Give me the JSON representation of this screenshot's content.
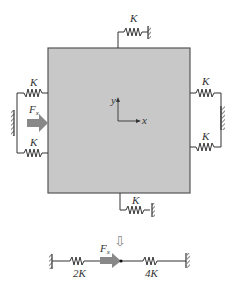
{
  "diagram": {
    "type": "spring-mass equivalence",
    "block": {
      "fill": "#c8c8c8",
      "border": "#555555"
    },
    "axes": {
      "x_label": "x",
      "y_label": "y"
    },
    "springs": {
      "top": {
        "label": "K"
      },
      "bottom": {
        "label": "K"
      },
      "left_upper": {
        "label": "K"
      },
      "left_lower": {
        "label": "K"
      },
      "right_upper": {
        "label": "K"
      },
      "right_lower": {
        "label": "K"
      }
    },
    "force": {
      "label": "F",
      "subscript": "x",
      "color": "#888888"
    },
    "arrow_down": {
      "symbol": "⇩"
    },
    "equivalent": {
      "left_spring": {
        "label": "2K"
      },
      "right_spring": {
        "label": "4K"
      },
      "force": {
        "label": "F",
        "subscript": "x"
      }
    }
  }
}
